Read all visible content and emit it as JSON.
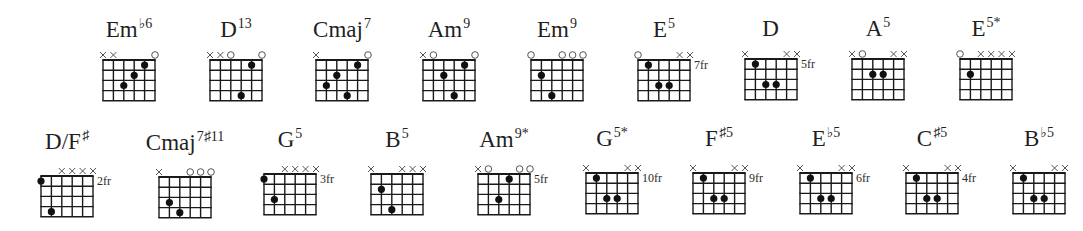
{
  "diagram": {
    "strings": 6,
    "frets_shown": 4,
    "string_order": "low E (6) on left to high E (1) on right",
    "colors": {
      "line": "#1a1a1a",
      "dot": "#111111",
      "marker": "#555555",
      "background": "#ffffff"
    }
  },
  "rows": [
    {
      "chords": [
        {
          "root": "Em",
          "ext": "♭6",
          "x": 103,
          "y": 60,
          "fret_label": "",
          "markers": [
            "x",
            "x",
            "",
            "",
            "",
            "o"
          ],
          "dots": [
            [
              4,
              3
            ],
            [
              3,
              2
            ],
            [
              2,
              1
            ]
          ]
        },
        {
          "root": "D",
          "ext": "13",
          "x": 210,
          "y": 60,
          "fret_label": "",
          "markers": [
            "x",
            "x",
            "o",
            "",
            "",
            "o"
          ],
          "dots": [
            [
              3,
              4
            ],
            [
              2,
              1
            ]
          ]
        },
        {
          "root": "Cmaj",
          "ext": "7",
          "x": 316,
          "y": 60,
          "fret_label": "",
          "markers": [
            "x",
            "",
            "",
            "",
            "",
            "o"
          ],
          "dots": [
            [
              5,
              3
            ],
            [
              4,
              2
            ],
            [
              3,
              4
            ],
            [
              2,
              1
            ]
          ]
        },
        {
          "root": "Am",
          "ext": "9",
          "x": 423,
          "y": 60,
          "fret_label": "",
          "markers": [
            "x",
            "o",
            "",
            "",
            "",
            "o"
          ],
          "dots": [
            [
              4,
              2
            ],
            [
              3,
              4
            ],
            [
              2,
              1
            ]
          ]
        },
        {
          "root": "Em",
          "ext": "9",
          "x": 531,
          "y": 60,
          "fret_label": "",
          "markers": [
            "o",
            "",
            "",
            "o",
            "o",
            "o"
          ],
          "dots": [
            [
              5,
              2
            ],
            [
              4,
              4
            ]
          ]
        },
        {
          "root": "E",
          "ext": "5",
          "x": 638,
          "y": 60,
          "fret_label": "7fr",
          "markers": [
            "o",
            "",
            "",
            "",
            "x",
            "x"
          ],
          "dots": [
            [
              5,
              1
            ],
            [
              4,
              3
            ],
            [
              3,
              3
            ]
          ]
        },
        {
          "root": "D",
          "ext": "",
          "x": 745,
          "y": 59,
          "fret_label": "5fr",
          "markers": [
            "x",
            "",
            "",
            "",
            "x",
            "x"
          ],
          "dots": [
            [
              5,
              1
            ],
            [
              4,
              3
            ],
            [
              3,
              3
            ]
          ]
        },
        {
          "root": "A",
          "ext": "5",
          "x": 852,
          "y": 59,
          "fret_label": "",
          "markers": [
            "x",
            "o",
            "",
            "",
            "x",
            "x"
          ],
          "dots": [
            [
              4,
              2
            ],
            [
              3,
              2
            ]
          ]
        },
        {
          "root": "E",
          "ext": "5*",
          "x": 960,
          "y": 59,
          "fret_label": "",
          "markers": [
            "o",
            "",
            "x",
            "x",
            "x",
            "x"
          ],
          "dots": [
            [
              5,
              2
            ]
          ]
        }
      ]
    },
    {
      "chords": [
        {
          "root": "D/F",
          "ext": "♯",
          "x": 41,
          "y": 176,
          "fret_label": "2fr",
          "markers": [
            "",
            "",
            "x",
            "x",
            "x",
            "x"
          ],
          "dots": [
            [
              6,
              1
            ],
            [
              5,
              4
            ]
          ]
        },
        {
          "root": "Cmaj",
          "ext": "7♯11",
          "x": 159,
          "y": 177,
          "fret_label": "",
          "markers": [
            "x",
            "",
            "",
            "o",
            "o",
            "o"
          ],
          "dots": [
            [
              5,
              3
            ],
            [
              4,
              4
            ]
          ]
        },
        {
          "root": "G",
          "ext": "5",
          "x": 264,
          "y": 174,
          "fret_label": "3fr",
          "markers": [
            "",
            "",
            "x",
            "x",
            "x",
            "x"
          ],
          "dots": [
            [
              6,
              1
            ],
            [
              5,
              3
            ]
          ]
        },
        {
          "root": "B",
          "ext": "5",
          "x": 371,
          "y": 174,
          "fret_label": "",
          "markers": [
            "x",
            "",
            "",
            "x",
            "x",
            "x"
          ],
          "dots": [
            [
              5,
              2
            ],
            [
              4,
              4
            ]
          ]
        },
        {
          "root": "Am",
          "ext": "9*",
          "x": 478,
          "y": 174,
          "fret_label": "5fr",
          "markers": [
            "x",
            "o",
            "",
            "",
            "o",
            "o"
          ],
          "dots": [
            [
              4,
              3
            ],
            [
              3,
              1
            ]
          ]
        },
        {
          "root": "G",
          "ext": "5*",
          "x": 586,
          "y": 173,
          "fret_label": "10fr",
          "markers": [
            "x",
            "",
            "",
            "",
            "x",
            "x"
          ],
          "dots": [
            [
              5,
              1
            ],
            [
              4,
              3
            ],
            [
              3,
              3
            ]
          ]
        },
        {
          "root": "F",
          "ext": "♯5",
          "x": 693,
          "y": 173,
          "fret_label": "9fr",
          "markers": [
            "x",
            "",
            "",
            "",
            "x",
            "x"
          ],
          "dots": [
            [
              5,
              1
            ],
            [
              4,
              3
            ],
            [
              3,
              3
            ]
          ]
        },
        {
          "root": "E",
          "ext": "♭5",
          "x": 800,
          "y": 173,
          "fret_label": "6fr",
          "markers": [
            "x",
            "",
            "",
            "",
            "x",
            "x"
          ],
          "dots": [
            [
              5,
              1
            ],
            [
              4,
              3
            ],
            [
              3,
              3
            ]
          ]
        },
        {
          "root": "C",
          "ext": "♯5",
          "x": 906,
          "y": 173,
          "fret_label": "4fr",
          "markers": [
            "x",
            "",
            "",
            "",
            "x",
            "x"
          ],
          "dots": [
            [
              5,
              1
            ],
            [
              4,
              3
            ],
            [
              3,
              3
            ]
          ]
        },
        {
          "root": "B",
          "ext": "♭5",
          "x": 1013,
          "y": 173,
          "fret_label": "",
          "markers": [
            "x",
            "",
            "",
            "",
            "x",
            "x"
          ],
          "dots": [
            [
              5,
              1
            ],
            [
              4,
              3
            ],
            [
              3,
              3
            ]
          ]
        }
      ]
    }
  ]
}
